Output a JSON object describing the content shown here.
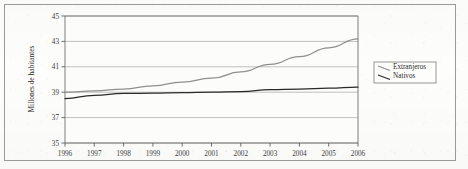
{
  "figure": {
    "border_color": "#9a9a9a",
    "background": "#fdfdfc"
  },
  "chart_data": {
    "type": "line",
    "title": "",
    "xlabel": "",
    "ylabel": "Millones de habitantes",
    "x": [
      1996,
      1997,
      1998,
      1999,
      2000,
      2001,
      2002,
      2003,
      2004,
      2005,
      2006
    ],
    "categories": [
      "1996",
      "1997",
      "1998",
      "1999",
      "2000",
      "2001",
      "2002",
      "2003",
      "2004",
      "2005",
      "2006"
    ],
    "series": [
      {
        "name": "Extranjeros",
        "color": "#8f8f8f",
        "values": [
          39.0,
          39.1,
          39.25,
          39.5,
          39.8,
          40.1,
          40.6,
          41.2,
          41.8,
          42.5,
          43.2
        ]
      },
      {
        "name": "Nativos",
        "color": "#2a2a2a",
        "values": [
          38.5,
          38.75,
          38.9,
          38.93,
          38.97,
          39.0,
          39.05,
          39.2,
          39.25,
          39.32,
          39.4
        ]
      }
    ],
    "ylim": [
      35,
      45
    ],
    "yticks": [
      35,
      37,
      39,
      41,
      43,
      45
    ],
    "ytick_labels": [
      "35",
      "37",
      "39",
      "41",
      "43",
      "45"
    ],
    "xlim": [
      1996,
      2006
    ],
    "grid": "horizontal",
    "legend_position": "right-outside",
    "legend": [
      {
        "label": "Extranjeros",
        "color": "#8f8f8f"
      },
      {
        "label": "Nativos",
        "color": "#2a2a2a"
      }
    ]
  },
  "axis": {
    "y_title": "Millones de habitantes"
  }
}
